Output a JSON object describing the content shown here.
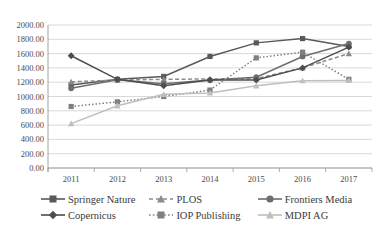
{
  "chart_data": {
    "type": "line",
    "title": "",
    "xlabel": "",
    "ylabel": "",
    "categories": [
      "2011",
      "2012",
      "2013",
      "2014",
      "2015",
      "2016",
      "2017"
    ],
    "x": [
      2011,
      2012,
      2013,
      2014,
      2015,
      2016,
      2017
    ],
    "ylim": [
      0,
      2000
    ],
    "ytick_step": 200,
    "ytick_labels": [
      "0.00",
      "200.00",
      "400.00",
      "600.00",
      "800.00",
      "1000.00",
      "1200.00",
      "1400.00",
      "1600.00",
      "1800.00",
      "2000.00"
    ],
    "grid": true,
    "legend_position": "bottom",
    "series": [
      {
        "name": "Springer Nature",
        "marker": "square",
        "line_style": "solid",
        "color": "#595959",
        "values": [
          1160,
          1240,
          1280,
          1560,
          1750,
          1810,
          1700
        ]
      },
      {
        "name": "PLOS",
        "marker": "triangle",
        "line_style": "dashed",
        "color": "#8c8c8c",
        "values": [
          1205,
          1230,
          1240,
          1245,
          1250,
          1400,
          1600
        ]
      },
      {
        "name": "Frontiers Media",
        "marker": "circle",
        "line_style": "solid",
        "color": "#6e6e6e",
        "values": [
          1115,
          1235,
          1180,
          1230,
          1270,
          1560,
          1740
        ]
      },
      {
        "name": "Copernicus",
        "marker": "diamond",
        "line_style": "solid",
        "color": "#4d4d4d",
        "values": [
          1570,
          1240,
          1150,
          1230,
          1230,
          1400,
          1690
        ]
      },
      {
        "name": "IOP Publishing",
        "marker": "square",
        "line_style": "dotted",
        "color": "#808080",
        "values": [
          860,
          925,
          1000,
          1090,
          1540,
          1620,
          1240
        ]
      },
      {
        "name": "MDPI AG",
        "marker": "triangle",
        "line_style": "solid",
        "color": "#bfbfbf",
        "values": [
          620,
          870,
          1030,
          1050,
          1150,
          1220,
          1225
        ]
      }
    ]
  },
  "legend": {
    "items": [
      {
        "label": "Springer Nature"
      },
      {
        "label": "PLOS"
      },
      {
        "label": "Frontiers Media"
      },
      {
        "label": "Copernicus"
      },
      {
        "label": "IOP Publishing"
      },
      {
        "label": "MDPI AG"
      }
    ]
  }
}
